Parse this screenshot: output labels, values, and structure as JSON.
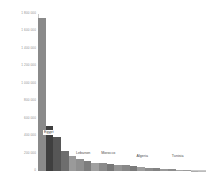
{
  "chart_data": {
    "type": "bar",
    "title": "",
    "subtitle": "",
    "xlabel": "",
    "ylabel": "",
    "grid": false,
    "legend": "none",
    "ylim": [
      0,
      1800000
    ],
    "ytick_labels": [
      "1 800 000",
      "1 600 000",
      "1 400 000",
      "1 200 000",
      "1 000 000",
      "800 000",
      "600 000",
      "400 000",
      "200 000",
      "0"
    ],
    "ytick_values": [
      1800000,
      1600000,
      1400000,
      1200000,
      1000000,
      800000,
      600000,
      400000,
      200000,
      0
    ],
    "categories": [
      "Egypt",
      "Syria",
      "Iraq",
      "Sudan",
      "Jordan",
      "Lebanon",
      "Morocco",
      "Yemen",
      "Libya",
      "Palestine",
      "Saudi Arabia",
      "Somalia",
      "Algeria",
      "Kuwait",
      "Mauritania",
      "Tunisia",
      "Oman",
      "Qatar",
      "Bahrain",
      "United Arab Emirates",
      "Djibouti",
      "Comoros"
    ],
    "values": [
      1760000,
      520000,
      390000,
      235000,
      175000,
      135000,
      118000,
      96000,
      88000,
      80000,
      72000,
      64000,
      52000,
      44000,
      38000,
      31000,
      24000,
      18000,
      13000,
      9000,
      5000,
      2000
    ],
    "bar_colors": [
      "#8a8a8a",
      "#3f3f3f",
      "#565656",
      "#6e6e6e",
      "#9a9a9a",
      "#8f8f8f",
      "#7d7d7d",
      "#a0a0a0",
      "#8a8a8a",
      "#777777",
      "#949494",
      "#888888",
      "#7a7a7a",
      "#9e9e9e",
      "#8c8c8c",
      "#828282",
      "#999999",
      "#8d8d8d",
      "#a5a5a5",
      "#9b9b9b",
      "#adadad",
      "#bcbcbc"
    ],
    "callouts": [
      {
        "label": "Egypt",
        "left_pct": 3,
        "bottom_pct": 23,
        "boxed": true
      },
      {
        "label": "Lebanon",
        "left_pct": 22,
        "bottom_pct": 10,
        "boxed": false
      },
      {
        "label": "Morocco",
        "left_pct": 37,
        "bottom_pct": 10,
        "boxed": false
      },
      {
        "label": "Algeria",
        "left_pct": 58,
        "bottom_pct": 8,
        "boxed": false
      },
      {
        "label": "Tunisia",
        "left_pct": 79,
        "bottom_pct": 8,
        "boxed": false
      }
    ],
    "axis_color": "#c9c9c9",
    "tick_text_color": "#8d8d8d",
    "background": "#ffffff"
  }
}
